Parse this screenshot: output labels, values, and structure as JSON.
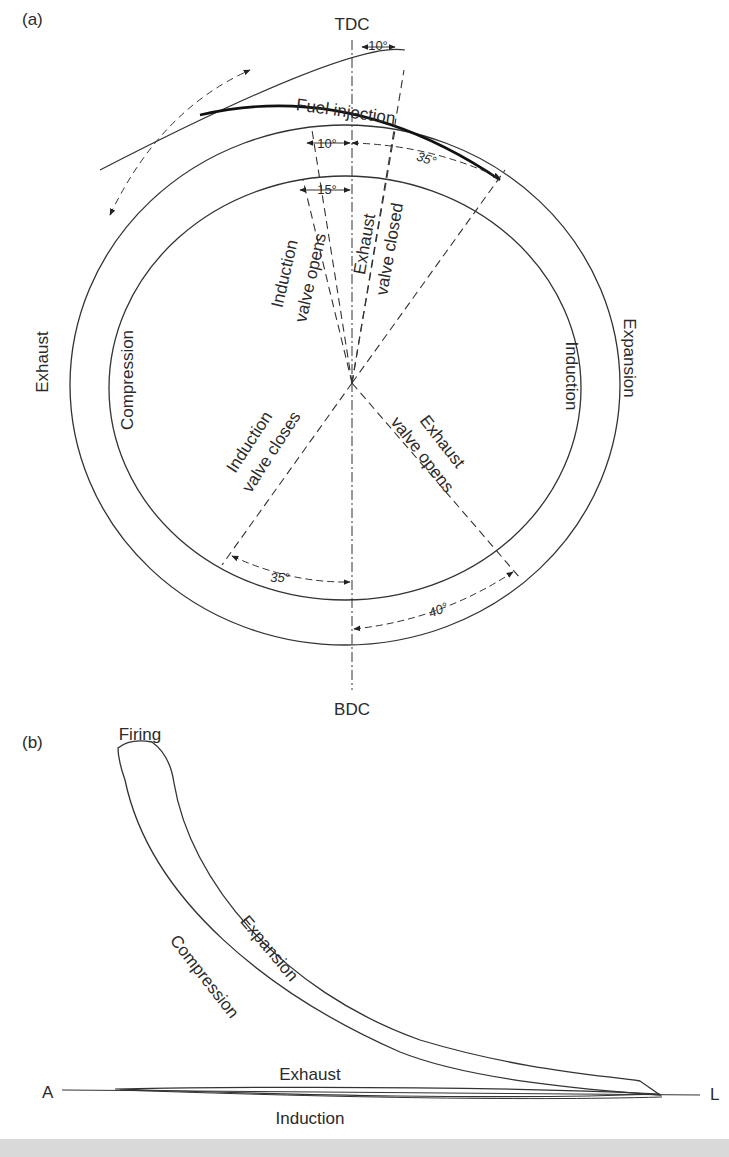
{
  "panel_a": {
    "label": "(a)",
    "tdc": "TDC",
    "bdc": "BDC",
    "outer_ring": {
      "left": "Exhaust",
      "right": "Expansion"
    },
    "inner_ring": {
      "left": "Compression",
      "right": "Induction"
    },
    "fuel_injection": "Fuel injection",
    "angles": {
      "fuel_start_before_tdc": "10°",
      "fuel_end_after_tdc": "35°",
      "exhaust_closed_after_tdc": "10°",
      "induction_opens_before_tdc": "15°",
      "induction_closes_after_bdc": "35°",
      "exhaust_opens_before_bdc": "40°"
    },
    "radial_labels": {
      "induction_opens": [
        "Induction",
        "valve opens"
      ],
      "exhaust_closed": [
        "Exhaust",
        "valve closed"
      ],
      "induction_closes": [
        "Induction",
        "valve closes"
      ],
      "exhaust_opens": [
        "Exhaust",
        "valve opens"
      ]
    }
  },
  "panel_b": {
    "label": "(b)",
    "firing": "Firing",
    "expansion": "Expansion",
    "compression": "Compression",
    "exhaust": "Exhaust",
    "induction": "Induction",
    "axis_left": "A",
    "axis_right": "L"
  }
}
